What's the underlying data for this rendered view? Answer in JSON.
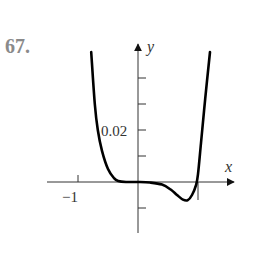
{
  "problem_number": "67.",
  "chart_data": {
    "type": "line",
    "title": "",
    "xlabel": "x",
    "ylabel": "y",
    "x_tick_labels": [
      "−1",
      "1"
    ],
    "x_ticks": [
      -1,
      1
    ],
    "y_tick_labels": [
      "0.02"
    ],
    "y_ticks": [
      -0.01,
      0.01,
      0.02,
      0.03,
      0.04
    ],
    "xlim": [
      -1.5,
      1.65
    ],
    "ylim": [
      -0.019,
      0.05
    ],
    "grid": false,
    "legend": "none",
    "series": [
      {
        "name": "curve",
        "x": [
          -0.78,
          -0.72,
          -0.67,
          -0.6,
          -0.5,
          -0.4,
          -0.33,
          -0.2,
          0,
          0.2,
          0.4,
          0.55,
          0.65,
          0.75,
          0.83,
          0.9,
          0.97,
          1.0,
          1.05,
          1.12,
          1.2
        ],
        "y": [
          0.05,
          0.03,
          0.02,
          0.012,
          0.005,
          0.0015,
          0.0004,
          0.0,
          0.0,
          -0.0002,
          -0.001,
          -0.003,
          -0.005,
          -0.0068,
          -0.007,
          -0.005,
          -0.001,
          0.003,
          0.015,
          0.032,
          0.05
        ]
      }
    ]
  }
}
